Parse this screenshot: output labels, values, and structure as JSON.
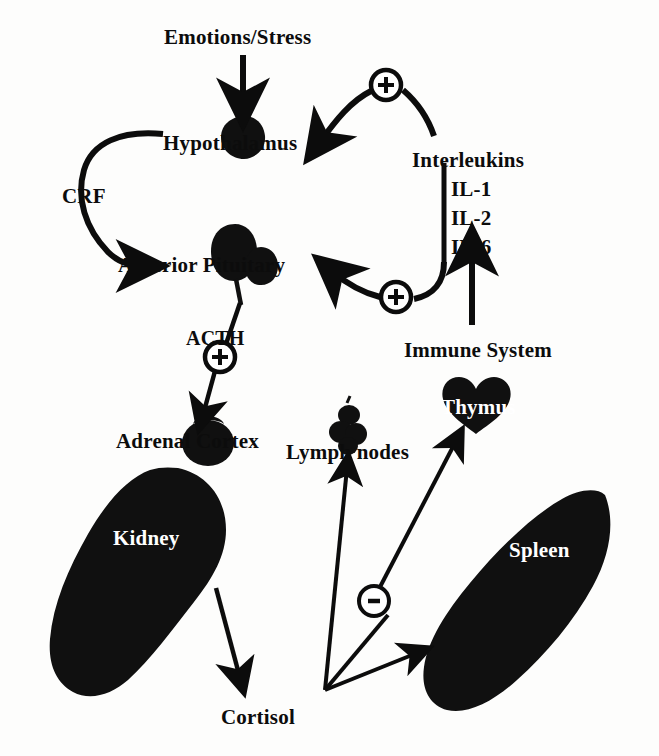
{
  "diagram": {
    "background_color": "#fdfdfc",
    "ink_color": "#0c0c0c",
    "organ_label_color": "#ffffff"
  },
  "nodes": {
    "emotions_stress": {
      "label": "Emotions/Stress",
      "x": 164,
      "y": 27
    },
    "hypothalamus": {
      "label": "Hypothalamus",
      "x": 163,
      "y": 133
    },
    "crf": {
      "label": "CRF",
      "x": 62,
      "y": 186
    },
    "anterior_pituitary": {
      "label": "Anterior Pituitary",
      "x": 118,
      "y": 255
    },
    "acth": {
      "label": "ACTH",
      "x": 186,
      "y": 328
    },
    "adrenal_cortex": {
      "label": "Adrenal Cortex",
      "x": 116,
      "y": 431
    },
    "kidney": {
      "label": "Kidney",
      "x": 113,
      "y": 528
    },
    "cortisol": {
      "label": "Cortisol",
      "x": 221,
      "y": 707
    },
    "lymph_nodes": {
      "label": "Lymph nodes",
      "x": 286,
      "y": 442
    },
    "thymus": {
      "label": "Thymus",
      "x": 441,
      "y": 397
    },
    "spleen": {
      "label": "Spleen",
      "x": 509,
      "y": 540
    },
    "immune_system": {
      "label": "Immune System",
      "x": 404,
      "y": 340
    },
    "interleukins": {
      "label": "Interleukins",
      "x": 412,
      "y": 150
    },
    "il_1": {
      "label": "IL-1",
      "x": 451,
      "y": 179
    },
    "il_2": {
      "label": "IL-2",
      "x": 451,
      "y": 208
    },
    "il_6": {
      "label": "IL-6",
      "x": 451,
      "y": 237
    }
  },
  "signs": {
    "plus_interleukins_to_hypothalamus": {
      "symbol": "+",
      "x": 386,
      "y": 85
    },
    "plus_interleukins_to_pituitary": {
      "symbol": "+",
      "x": 396,
      "y": 296
    },
    "plus_acth_to_adrenal": {
      "symbol": "+",
      "x": 212,
      "y": 357
    },
    "minus_cortisol_to_immune": {
      "symbol": "–",
      "x": 373,
      "y": 600
    }
  },
  "edges": [
    {
      "name": "emotions-to-hypothalamus",
      "from": "emotions_stress",
      "to": "hypothalamus",
      "sign": ""
    },
    {
      "name": "interleukins-to-hypothalamus",
      "from": "interleukins",
      "to": "hypothalamus",
      "sign": "+"
    },
    {
      "name": "hypothalamus-to-pituitary",
      "from": "hypothalamus",
      "to": "anterior_pituitary",
      "sign": "",
      "mediator": "CRF"
    },
    {
      "name": "interleukins-to-pituitary",
      "from": "interleukins",
      "to": "anterior_pituitary",
      "sign": "+"
    },
    {
      "name": "pituitary-to-adrenal",
      "from": "anterior_pituitary",
      "to": "adrenal_cortex",
      "sign": "+",
      "mediator": "ACTH"
    },
    {
      "name": "immune-to-interleukins",
      "from": "immune_system",
      "to": "interleukins",
      "sign": ""
    },
    {
      "name": "kidney-to-cortisol",
      "from": "kidney",
      "to": "cortisol",
      "sign": ""
    },
    {
      "name": "cortisol-to-lymph-nodes",
      "from": "cortisol",
      "to": "lymph_nodes",
      "sign": "–"
    },
    {
      "name": "cortisol-to-thymus",
      "from": "cortisol",
      "to": "thymus",
      "sign": "–"
    },
    {
      "name": "cortisol-to-spleen",
      "from": "cortisol",
      "to": "spleen",
      "sign": "–"
    }
  ]
}
